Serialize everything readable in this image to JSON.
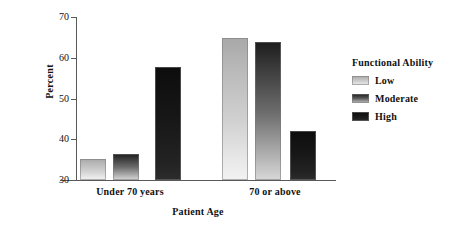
{
  "chart_data": {
    "type": "bar",
    "title": "",
    "xlabel": "Patient Age",
    "ylabel": "Percent",
    "categories": [
      "Under 70 years",
      "70 or above"
    ],
    "series": [
      {
        "name": "Low",
        "values": [
          35.2,
          64.8
        ],
        "color": "#c6c6c6"
      },
      {
        "name": "Moderate",
        "values": [
          36.4,
          63.8
        ],
        "color": "#5c5c5c"
      },
      {
        "name": "High",
        "values": [
          57.8,
          42.0
        ],
        "color": "#1a1a1a"
      }
    ],
    "ylim": [
      30,
      70
    ],
    "yticks": [
      30,
      40,
      50,
      60,
      70
    ],
    "ytick_labels": [
      "30",
      "40",
      "50",
      "60",
      "70"
    ],
    "grid": false,
    "legend_position": "right",
    "legend_title": "Functional Ability"
  },
  "legend": {
    "title": "Functional Ability",
    "items": [
      {
        "label": "Low"
      },
      {
        "label": "Moderate"
      },
      {
        "label": "High"
      }
    ]
  },
  "axes": {
    "y_title": "Percent",
    "x_title": "Patient Age",
    "y_ticks": [
      "70",
      "60",
      "50",
      "40",
      "30"
    ],
    "x_categories": [
      "Under 70 years",
      "70 or above"
    ]
  }
}
